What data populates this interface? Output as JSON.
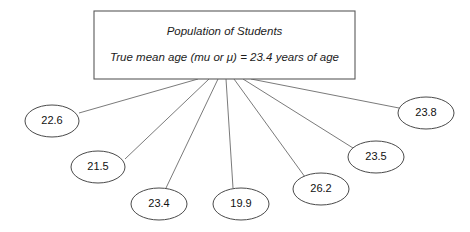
{
  "diagram": {
    "type": "sampling-distribution-fan",
    "background_color": "#ffffff",
    "line_color": "#6b6b6b",
    "box_stroke_color": "#5a5a5a",
    "ellipse_stroke_color": "#4a4a4a",
    "text_color": "#111111"
  },
  "population": {
    "title": "Population of Students",
    "parameter_line": "True mean age (mu or μ) = 23.4 years of age",
    "true_mean": 23.4,
    "units": "years of age"
  },
  "samples": [
    {
      "label": "22.6",
      "value": 22.6,
      "cx": 52,
      "cy": 121,
      "rx": 27,
      "ry": 16,
      "anchor_x": 79,
      "anchor_y": 113
    },
    {
      "label": "21.5",
      "value": 21.5,
      "cx": 98,
      "cy": 167,
      "rx": 27,
      "ry": 16,
      "anchor_x": 125,
      "anchor_y": 159
    },
    {
      "label": "23.4",
      "value": 23.4,
      "cx": 159,
      "cy": 204,
      "rx": 28,
      "ry": 16,
      "anchor_x": 166,
      "anchor_y": 188
    },
    {
      "label": "19.9",
      "value": 19.9,
      "cx": 241,
      "cy": 204,
      "rx": 28,
      "ry": 16,
      "anchor_x": 233,
      "anchor_y": 188
    },
    {
      "label": "26.2",
      "value": 26.2,
      "cx": 321,
      "cy": 189,
      "rx": 28,
      "ry": 16,
      "anchor_x": 305,
      "anchor_y": 177
    },
    {
      "label": "23.5",
      "value": 23.5,
      "cx": 376,
      "cy": 157,
      "rx": 28,
      "ry": 16,
      "anchor_x": 353,
      "anchor_y": 148
    },
    {
      "label": "23.8",
      "value": 23.8,
      "cx": 426,
      "cy": 113,
      "rx": 28,
      "ry": 16,
      "anchor_x": 399,
      "anchor_y": 108
    }
  ],
  "fan_origins": [
    {
      "x": 198,
      "y": 79
    },
    {
      "x": 209,
      "y": 79
    },
    {
      "x": 218,
      "y": 79
    },
    {
      "x": 226,
      "y": 79
    },
    {
      "x": 234,
      "y": 79
    },
    {
      "x": 243,
      "y": 79
    },
    {
      "x": 251,
      "y": 79
    }
  ],
  "box_geometry": {
    "x": 94,
    "y": 11,
    "width": 261,
    "height": 68
  }
}
